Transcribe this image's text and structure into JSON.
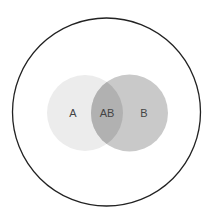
{
  "diagram": {
    "type": "venn",
    "universe": {
      "cx": 106.5,
      "cy": 112,
      "r": 94,
      "stroke": "#222222",
      "fill": "#ffffff"
    },
    "sets": [
      {
        "label": "A",
        "cx": 85,
        "cy": 113,
        "r": 38,
        "fill": "#ececec",
        "label_x": 73,
        "label_y": 117
      },
      {
        "label": "B",
        "cx": 129.5,
        "cy": 113,
        "r": 38.5,
        "fill": "#c9c9c9",
        "label_x": 144,
        "label_y": 117
      }
    ],
    "intersection": {
      "label": "AB",
      "fill": "#b1b1b1",
      "label_x": 107,
      "label_y": 117
    }
  }
}
